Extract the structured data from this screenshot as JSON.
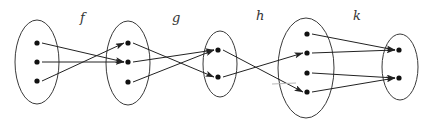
{
  "diagram": {
    "type": "function-composition-mapping",
    "functions": [
      {
        "label": "f",
        "from": "A",
        "to": "B",
        "mappings": [
          [
            0,
            1
          ],
          [
            1,
            1
          ],
          [
            2,
            0
          ]
        ]
      },
      {
        "label": "g",
        "from": "B",
        "to": "C",
        "mappings": [
          [
            0,
            1
          ],
          [
            1,
            0
          ],
          [
            2,
            0
          ]
        ]
      },
      {
        "label": "h",
        "from": "C",
        "to": "D",
        "mappings": [
          [
            0,
            3
          ],
          [
            1,
            1
          ]
        ]
      },
      {
        "label": "k",
        "from": "D",
        "to": "E",
        "mappings": [
          [
            0,
            0
          ],
          [
            1,
            0
          ],
          [
            2,
            1
          ],
          [
            3,
            1
          ]
        ]
      }
    ],
    "sets": [
      {
        "id": "A",
        "elements": 3
      },
      {
        "id": "B",
        "elements": 3
      },
      {
        "id": "C",
        "elements": 2
      },
      {
        "id": "D",
        "elements": 4
      },
      {
        "id": "E",
        "elements": 2
      }
    ],
    "colors": {
      "stroke": "#222222",
      "dot": "#111111",
      "label": "#333333"
    }
  }
}
